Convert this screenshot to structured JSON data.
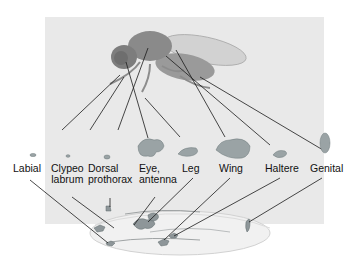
{
  "diagram": {
    "labels": [
      {
        "id": "labial",
        "text_lines": [
          "Labial"
        ]
      },
      {
        "id": "clypeo-labrum",
        "text_lines": [
          "Clypeo",
          "labrum"
        ]
      },
      {
        "id": "dorsal-prothorax",
        "text_lines": [
          "Dorsal",
          "prothorax"
        ]
      },
      {
        "id": "eye-antenna",
        "text_lines": [
          "Eye,",
          "antenna"
        ]
      },
      {
        "id": "leg",
        "text_lines": [
          "Leg"
        ]
      },
      {
        "id": "wing",
        "text_lines": [
          "Wing"
        ]
      },
      {
        "id": "haltere",
        "text_lines": [
          "Haltere"
        ]
      },
      {
        "id": "genital",
        "text_lines": [
          "Genital"
        ]
      }
    ],
    "colors": {
      "panel": "#e9e9e9",
      "disc": "#9aa3a5",
      "disc_dark": "#6f7a7c",
      "line": "#1a1a1a",
      "fly_body": "#8d8d8d",
      "fly_wing": "#cfcfcf"
    }
  }
}
